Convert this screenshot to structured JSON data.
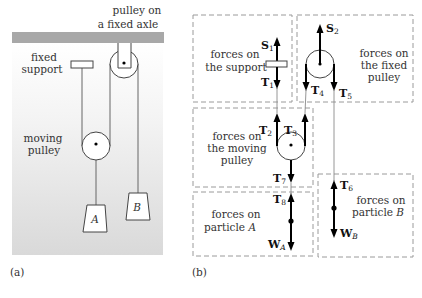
{
  "panel_a": {
    "caption": "(a)",
    "labels": {
      "fixed_axle_line1": "pulley on",
      "fixed_axle_line2": "a fixed axle",
      "support_line1": "fixed",
      "support_line2": "support",
      "moving_line1": "moving",
      "moving_line2": "pulley",
      "block_a": "A",
      "block_b": "B"
    },
    "colors": {
      "background_top": "#ffffff",
      "background_bottom": "#dcdcdc",
      "ceiling": "#a8a8a8"
    }
  },
  "panel_b": {
    "caption": "(b)",
    "boxes": {
      "support": {
        "line1": "forces on",
        "line2": "the support"
      },
      "fixed_pulley": {
        "line1": "forces on",
        "line2": "the fixed",
        "line3": "pulley"
      },
      "moving_pulley": {
        "line1": "forces on",
        "line2": "the moving",
        "line3": "pulley"
      },
      "particle_a": {
        "line1": "forces on",
        "line2": "particle",
        "line2_var": "A"
      },
      "particle_b": {
        "line1": "forces on",
        "line2": "particle",
        "line2_var": "B"
      }
    },
    "forces": {
      "S1": {
        "sym": "S",
        "sub": "1"
      },
      "T1": {
        "sym": "T",
        "sub": "1"
      },
      "S2": {
        "sym": "S",
        "sub": "2"
      },
      "T4": {
        "sym": "T",
        "sub": "4"
      },
      "T5": {
        "sym": "T",
        "sub": "5"
      },
      "T2": {
        "sym": "T",
        "sub": "2"
      },
      "T3": {
        "sym": "T",
        "sub": "3"
      },
      "T7": {
        "sym": "T",
        "sub": "7"
      },
      "T8": {
        "sym": "T",
        "sub": "8"
      },
      "WA": {
        "sym": "W",
        "sub": "A"
      },
      "T6": {
        "sym": "T",
        "sub": "6"
      },
      "WB": {
        "sym": "W",
        "sub": "B"
      }
    }
  }
}
